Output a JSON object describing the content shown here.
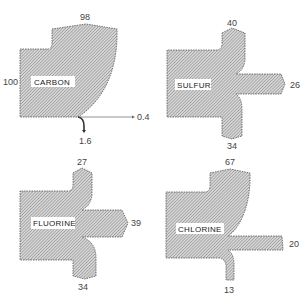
{
  "figure": {
    "type": "flow-diagram",
    "colors": {
      "hatch": "#8a8a8a",
      "outline": "#555555",
      "text": "#444444",
      "background": "#ffffff"
    }
  },
  "panels": [
    {
      "element": "CARBON",
      "inputs": [
        {
          "value": "98",
          "position": "top"
        },
        {
          "value": "100",
          "position": "left"
        }
      ],
      "outputs": [
        {
          "value": "0.4",
          "position": "right"
        },
        {
          "value": "1.6",
          "position": "bottom"
        }
      ]
    },
    {
      "element": "SULFUR",
      "inputs": [
        {
          "value": "40",
          "position": "top"
        }
      ],
      "outputs": [
        {
          "value": "26",
          "position": "right"
        },
        {
          "value": "34",
          "position": "bottom"
        }
      ]
    },
    {
      "element": "FLUORINE",
      "inputs": [
        {
          "value": "27",
          "position": "top"
        }
      ],
      "outputs": [
        {
          "value": "39",
          "position": "right"
        },
        {
          "value": "34",
          "position": "bottom"
        }
      ]
    },
    {
      "element": "CHLORINE",
      "inputs": [
        {
          "value": "67",
          "position": "top"
        }
      ],
      "outputs": [
        {
          "value": "20",
          "position": "right"
        },
        {
          "value": "13",
          "position": "bottom"
        }
      ]
    }
  ]
}
